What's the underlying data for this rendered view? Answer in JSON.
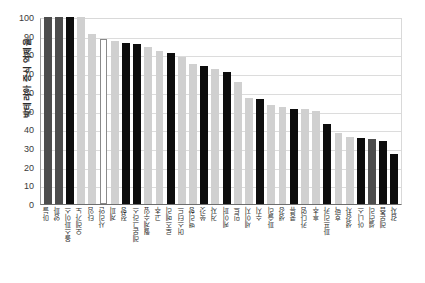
{
  "chart_data": {
    "type": "bar",
    "title": "",
    "xlabel": "",
    "ylabel": "박테리아 증식 억제율",
    "ylim": [
      0,
      100
    ],
    "yticks": [
      100,
      90,
      80,
      70,
      60,
      50,
      40,
      30,
      20,
      10,
      0
    ],
    "grid": true,
    "legend": "none",
    "categories": [
      "마늘",
      "양파",
      "올스파이스",
      "오레가노",
      "타임",
      "사리안",
      "계피",
      "정향",
      "레몬그라스",
      "월계수잎",
      "고추",
      "로즈메리",
      "머스터드",
      "백리향",
      "쑥갓",
      "겨자",
      "케이퍼",
      "민트",
      "세이지",
      "수지",
      "파슬리",
      "생강",
      "콩류",
      "카다멈",
      "후추",
      "파프리카",
      "호박",
      "생강차",
      "아니스",
      "셀러리",
      "레몬즙",
      "감자"
    ],
    "values": [
      100,
      100,
      100,
      100,
      91,
      88,
      87,
      86,
      85.5,
      84,
      82,
      80.5,
      78.5,
      75,
      74,
      72,
      70.5,
      65,
      56.5,
      56,
      53,
      52,
      51,
      51,
      50,
      43,
      38,
      36,
      35.5,
      35,
      33.5,
      27
    ],
    "colors": [
      "dark",
      "dark",
      "black",
      "light",
      "light",
      "white",
      "light",
      "black",
      "black",
      "light",
      "light",
      "black",
      "light",
      "light",
      "black",
      "light",
      "black",
      "light",
      "light",
      "black",
      "light",
      "light",
      "black",
      "light",
      "light",
      "black",
      "light",
      "light",
      "black",
      "dark",
      "black",
      "black"
    ],
    "color_hex": {
      "dark": "#4d4d4d",
      "black": "#0d0d0d",
      "light": "#d0d0d0",
      "white": "#ffffff",
      "mid": "#6a6a6a"
    }
  }
}
